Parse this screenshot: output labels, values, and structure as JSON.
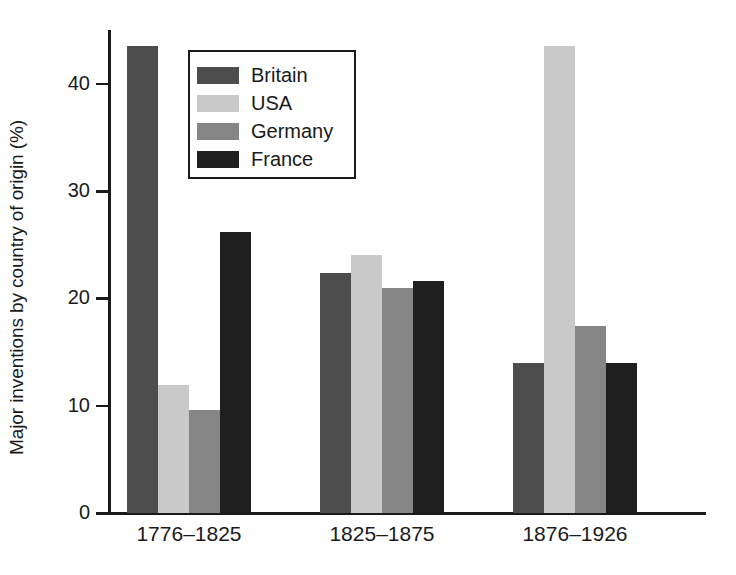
{
  "chart_data": {
    "type": "bar",
    "title": "",
    "xlabel": "",
    "ylabel": "Major inventions by country of origin (%)",
    "categories": [
      "1776–1825",
      "1825–1875",
      "1876–1926"
    ],
    "series": [
      {
        "name": "Britain",
        "color": "#4d4d4d",
        "values": [
          43.5,
          22.4,
          14.0
        ]
      },
      {
        "name": "USA",
        "color": "#c9c9c9",
        "values": [
          11.9,
          24.0,
          43.5
        ]
      },
      {
        "name": "Germany",
        "color": "#858585",
        "values": [
          9.6,
          21.0,
          17.4
        ]
      },
      {
        "name": "France",
        "color": "#1f1f1f",
        "values": [
          26.2,
          21.6,
          14.0
        ]
      }
    ],
    "ylim": [
      0,
      45
    ],
    "yticks": [
      0,
      10,
      20,
      30,
      40
    ],
    "ytick_labels": [
      "0",
      "10",
      "20",
      "30",
      "40"
    ],
    "grid": false,
    "legend_position": "upper-left-inside"
  },
  "legend": {
    "entries": [
      {
        "label": "Britain",
        "color": "#4d4d4d"
      },
      {
        "label": "USA",
        "color": "#c9c9c9"
      },
      {
        "label": "Germany",
        "color": "#858585"
      },
      {
        "label": "France",
        "color": "#1f1f1f"
      }
    ]
  },
  "axes": {
    "y_title": "Major inventions by country of origin (%)",
    "y_tick_labels": [
      "40",
      "30",
      "20",
      "10",
      "0"
    ],
    "x_tick_labels": [
      "1776–1825",
      "1825–1875",
      "1876–1926"
    ]
  }
}
